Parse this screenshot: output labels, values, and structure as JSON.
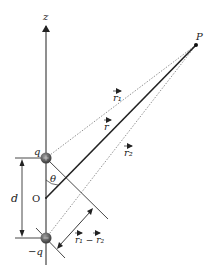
{
  "diagram": {
    "axis_label": "z",
    "point_label": "P",
    "origin_label": "O",
    "charge_top": "q",
    "charge_bottom": "−q",
    "separation_label": "d",
    "angle_label": "θ",
    "vector_r1": "r₁",
    "vector_r": "r",
    "vector_r2": "r₂",
    "difference_label": "r₁ − r₂",
    "colors": {
      "line": "#2a2a2a",
      "dotted": "#666666",
      "charge_fill": "#555555"
    }
  }
}
